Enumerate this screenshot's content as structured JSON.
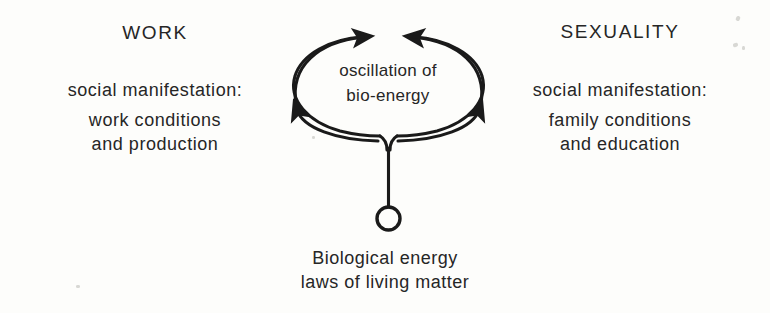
{
  "figure": {
    "type": "concept-diagram",
    "ink_color": "#1a1a1a",
    "paper_color": "#fdfdfb",
    "left_column": {
      "heading": "WORK",
      "lines": [
        "social manifestation:",
        "work conditions",
        "and production"
      ]
    },
    "right_column": {
      "heading": "SEXUALITY",
      "lines": [
        "social manifestation:",
        "family conditions",
        "and education"
      ]
    },
    "center_node": {
      "shape": "ellipse",
      "line_1": "oscillation of",
      "line_2": "bio-energy",
      "arrow_count": 4,
      "arrow_directions": [
        "up-right",
        "up-left",
        "up-left",
        "up-right"
      ]
    },
    "root_node": {
      "shape": "circle",
      "connector": "vertical-stem"
    },
    "caption": {
      "line_1": "Biological energy",
      "line_2": "laws of living matter"
    }
  }
}
